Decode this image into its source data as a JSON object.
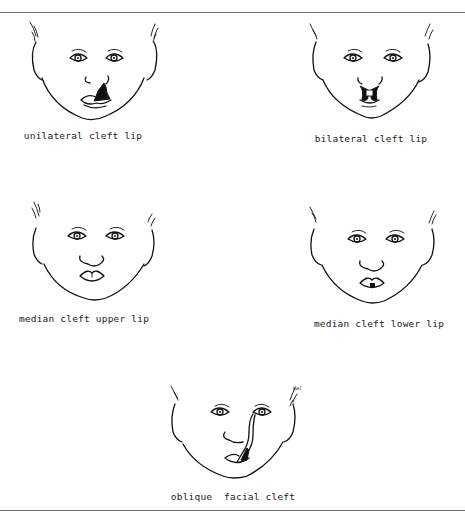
{
  "figure": {
    "panels": [
      {
        "id": "unilateral",
        "caption": "unilateral cleft lip"
      },
      {
        "id": "bilateral",
        "caption": "bilateral cleft lip"
      },
      {
        "id": "median-upper",
        "caption": "median cleft upper lip"
      },
      {
        "id": "median-lower",
        "caption": "median cleft lower lip"
      },
      {
        "id": "oblique",
        "caption": "oblique  facial cleft"
      }
    ],
    "signature": "Hal"
  }
}
